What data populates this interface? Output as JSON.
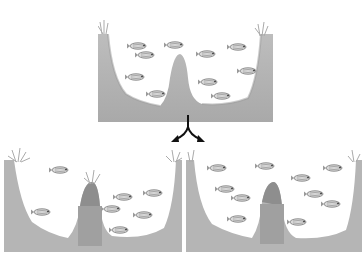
{
  "diagram": {
    "colors": {
      "ground": "#b5b5b5",
      "ground_dark": "#8e8e8e",
      "water": "#ffffff",
      "fish": "#9a9a9a",
      "arrow": "#111111"
    },
    "panels": [
      {
        "id": "top",
        "label": "Original basin",
        "fish_count": 10
      },
      {
        "id": "bottom-left",
        "label": "Divided basin A",
        "fish_count": 7
      },
      {
        "id": "bottom-right",
        "label": "Divided basin B",
        "fish_count": 10
      }
    ],
    "arrow": {
      "type": "split-arrow",
      "direction": "down-left and down-right"
    }
  }
}
